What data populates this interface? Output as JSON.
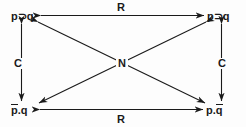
{
  "diagram": {
    "type": "logic-square",
    "background_color": "#fdfdfd",
    "line_color": "#1a1a1a",
    "nodes": [
      {
        "id": "top-left",
        "text": "p⊃q",
        "base": "p",
        "op": "⊃",
        "arg": "q",
        "position": "top-left"
      },
      {
        "id": "top-right",
        "text": "p⊃q",
        "base": "p",
        "op": "⊃",
        "arg": "q",
        "position": "top-right"
      },
      {
        "id": "bottom-left",
        "text": "p̄.q",
        "base": "p",
        "op": ".",
        "arg": "q",
        "position": "bottom-left",
        "negated": "p"
      },
      {
        "id": "bottom-right",
        "text": "p.q̄",
        "base": "p",
        "op": ".",
        "arg": "q",
        "position": "bottom-right",
        "negated": "q"
      }
    ],
    "node_text": {
      "top_left_p": "p",
      "top_left_op": "⊃",
      "top_left_q": "q",
      "top_right_p": "p",
      "top_right_op": "⊃",
      "top_right_q": "q",
      "bottom_left_p": "p",
      "bottom_left_op": ".",
      "bottom_left_q": "q",
      "bottom_right_p": "p",
      "bottom_right_op": ".",
      "bottom_right_q": "q"
    },
    "edges": [
      {
        "id": "top-horizontal",
        "label": "R",
        "from": "top-left",
        "to": "top-right",
        "arrows": "both"
      },
      {
        "id": "bottom-horizontal",
        "label": "R",
        "from": "bottom-left",
        "to": "bottom-right",
        "arrows": "both"
      },
      {
        "id": "left-vertical",
        "label": "C",
        "from": "top-left",
        "to": "bottom-left",
        "arrows": "both"
      },
      {
        "id": "right-vertical",
        "label": "C",
        "from": "top-right",
        "to": "bottom-right",
        "arrows": "both"
      },
      {
        "id": "diagonal-tl-br",
        "label": "N",
        "from": "top-left",
        "to": "bottom-right",
        "arrows": "both"
      },
      {
        "id": "diagonal-tr-bl",
        "label": "N",
        "from": "top-right",
        "to": "bottom-left",
        "arrows": "both"
      }
    ],
    "edge_labels": {
      "top": "R",
      "bottom": "R",
      "left": "C",
      "right": "C",
      "center": "N"
    }
  }
}
